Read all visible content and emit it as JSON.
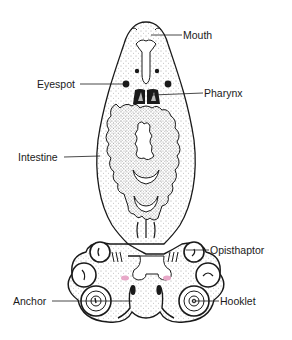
{
  "diagram": {
    "labels": [
      {
        "id": "mouth",
        "text": "Mouth"
      },
      {
        "id": "eyespot",
        "text": "Eyespot"
      },
      {
        "id": "pharynx",
        "text": "Pharynx"
      },
      {
        "id": "intestine",
        "text": "Intestine"
      },
      {
        "id": "opisthaptor",
        "text": "Opisthaptor"
      },
      {
        "id": "anchor",
        "text": "Anchor"
      },
      {
        "id": "hooklet",
        "text": "Hooklet"
      }
    ],
    "colors": {
      "ink": "#1a1a1a",
      "stipple": "#555555",
      "background": "#ffffff",
      "accent_pink": "#e8a8c8"
    }
  }
}
